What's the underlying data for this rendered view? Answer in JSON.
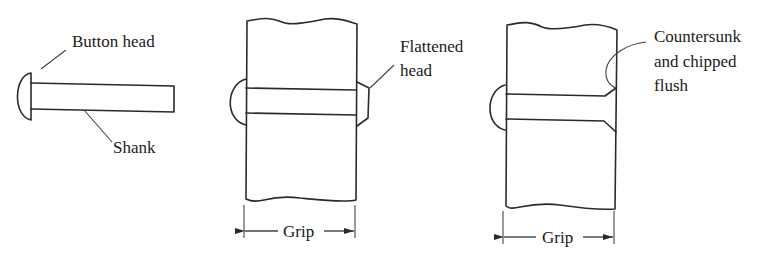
{
  "figure": {
    "background": "#ffffff",
    "line_color": "#2a2a2a",
    "panels": [
      {
        "id": "loose-rivet",
        "labels": {
          "button_head": "Button head",
          "shank": "Shank"
        }
      },
      {
        "id": "driven-rivet-flattened",
        "labels": {
          "flattened_line1": "Flattened",
          "flattened_line2": "head",
          "grip": "Grip"
        }
      },
      {
        "id": "driven-rivet-countersunk",
        "labels": {
          "countersunk_line1": "Countersunk",
          "countersunk_line2": "and chipped",
          "countersunk_line3": "flush",
          "grip": "Grip"
        }
      }
    ]
  }
}
